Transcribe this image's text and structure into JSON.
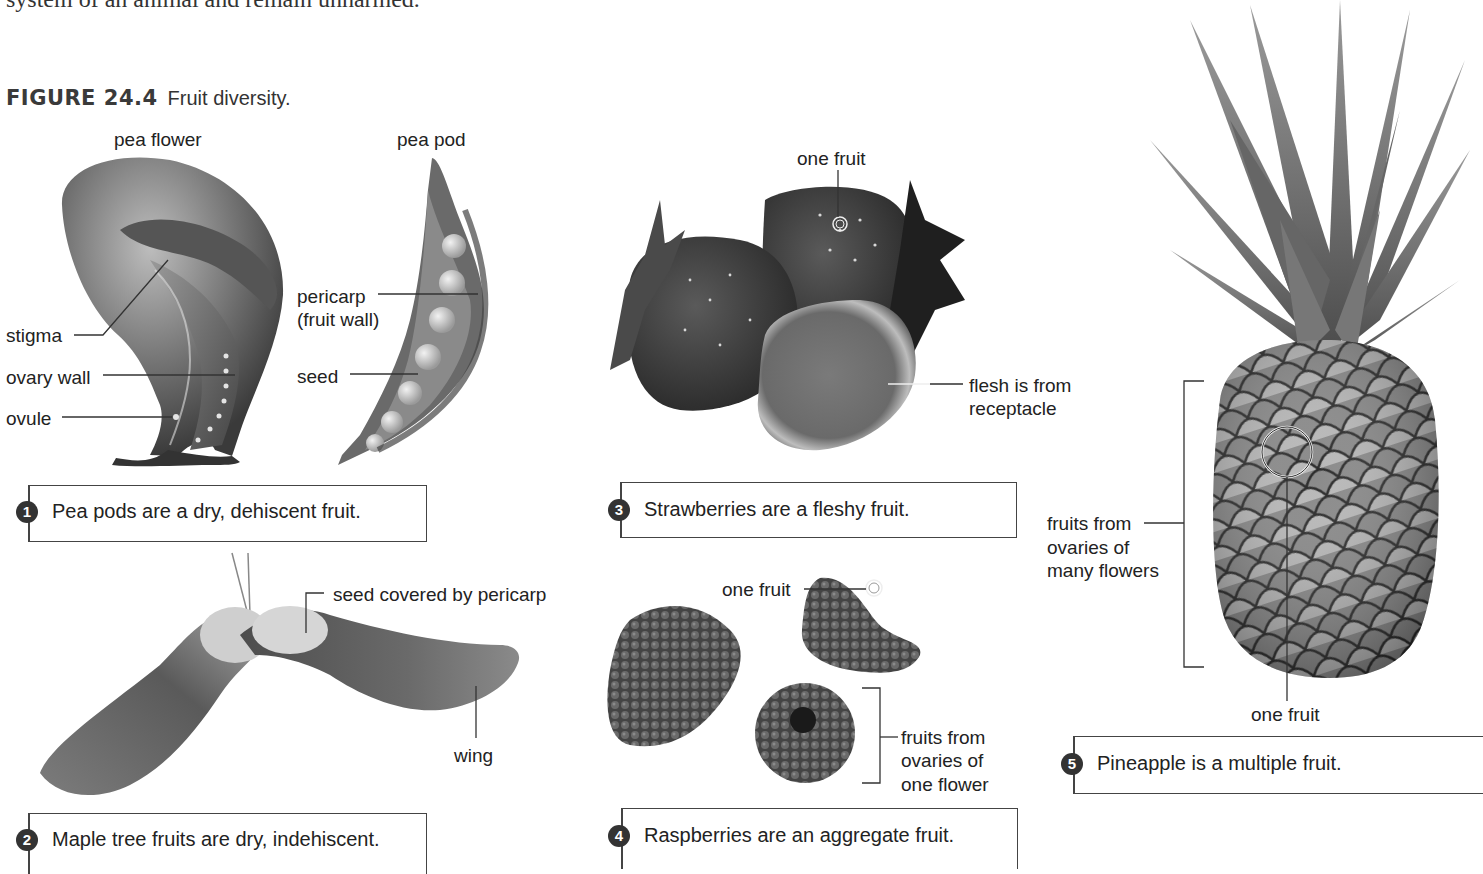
{
  "page": {
    "body_text_fragment": "system of an animal and remain unharmed."
  },
  "figure": {
    "number": "FIGURE 24.4",
    "title": "Fruit diversity."
  },
  "panels": [
    {
      "id": 1,
      "badge": "1",
      "caption": "Pea pods are a dry, dehiscent fruit.",
      "images": [
        {
          "name": "pea flower",
          "title": "pea flower",
          "labels": [
            "stigma",
            "ovary wall",
            "ovule"
          ]
        },
        {
          "name": "pea pod",
          "title": "pea pod",
          "labels": [
            "pericarp",
            "(fruit wall)",
            "seed"
          ]
        }
      ]
    },
    {
      "id": 2,
      "badge": "2",
      "caption": "Maple tree fruits are dry, indehiscent.",
      "labels": [
        "seed covered by pericarp",
        "wing"
      ]
    },
    {
      "id": 3,
      "badge": "3",
      "caption": "Strawberries are a fleshy fruit.",
      "labels": [
        "one fruit",
        "flesh is from",
        "receptacle"
      ]
    },
    {
      "id": 4,
      "badge": "4",
      "caption": "Raspberries are an aggregate fruit.",
      "labels": [
        "one fruit",
        "fruits from",
        "ovaries of",
        "one flower"
      ]
    },
    {
      "id": 5,
      "badge": "5",
      "caption": "Pineapple is a multiple fruit.",
      "labels": [
        "fruits from",
        "ovaries of",
        "many flowers",
        "one fruit"
      ]
    }
  ],
  "colors": {
    "text": "#222222",
    "badge": "#333333",
    "box_border": "#444444",
    "illustration_dark": "#3a3a3a",
    "illustration_mid": "#7a7a7a",
    "illustration_light": "#c8c8c8"
  }
}
